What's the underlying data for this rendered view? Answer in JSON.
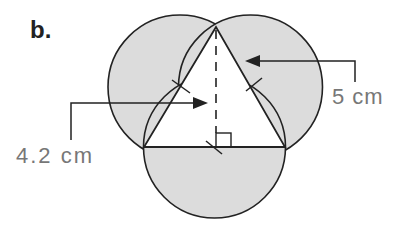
{
  "part_label": "b.",
  "labels": {
    "side_length": "5 cm",
    "height": "4.2 cm"
  },
  "colors": {
    "shade": "#dcdcdc",
    "stroke": "#222222",
    "label_text": "#777777"
  },
  "figure": {
    "triangle": {
      "apex": [
        216,
        27
      ],
      "base_left": [
        144,
        147
      ],
      "base_right": [
        285,
        147
      ]
    },
    "semicircles": 3
  }
}
